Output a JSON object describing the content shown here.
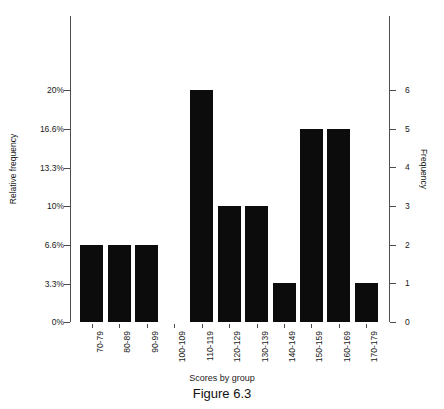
{
  "chart_data": {
    "type": "bar",
    "title": "",
    "caption": "Figure 6.3",
    "xlabel": "Scores by group",
    "ylabel": "Relative frequency",
    "ylabel_secondary": "Frequency",
    "grid": false,
    "legend": "none",
    "bar_color": "#0c0c0c",
    "axis_color": "#4d4d4d",
    "background": "#ffffff",
    "categories": [
      "70-79",
      "80-89",
      "90-99",
      "100-109",
      "110-119",
      "120-129",
      "130-139",
      "140-149",
      "150-159",
      "160-169",
      "170-179"
    ],
    "values": [
      2,
      2,
      2,
      0,
      6,
      3,
      3,
      1,
      5,
      5,
      1
    ],
    "relative_values": [
      6.6,
      6.6,
      6.6,
      0,
      20,
      10,
      10,
      3.3,
      16.6,
      16.6,
      3.3
    ],
    "ylim": [
      0,
      6
    ],
    "ylim_relative": [
      0,
      20
    ],
    "yticks_left": [
      "0%",
      "3.3%",
      "6.6%",
      "10%",
      "13.3%",
      "16.6%",
      "20%"
    ],
    "yticks_left_values": [
      0,
      3.3,
      6.6,
      10,
      13.3,
      16.6,
      20
    ],
    "yticks_right": [
      "0",
      "1",
      "2",
      "3",
      "4",
      "5",
      "6"
    ],
    "yticks_right_values": [
      0,
      1,
      2,
      3,
      4,
      5,
      6
    ]
  }
}
